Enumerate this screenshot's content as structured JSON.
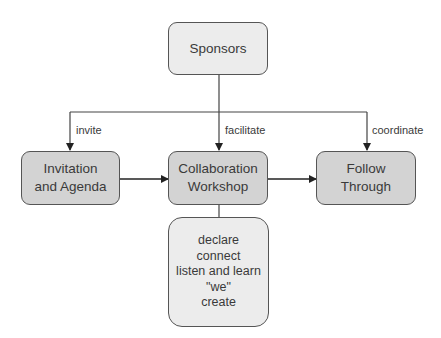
{
  "nodes": {
    "sponsors": {
      "label": "Sponsors"
    },
    "invitation": {
      "label": "Invitation\nand Agenda"
    },
    "workshop": {
      "label": "Collaboration\nWorkshop"
    },
    "follow": {
      "label": "Follow\nThrough"
    },
    "activities": {
      "label": "declare\nconnect\nlisten and learn\n\"we\"\ncreate"
    }
  },
  "edges": {
    "invite": "invite",
    "facilitate": "facilitate",
    "coordinate": "coordinate"
  },
  "colors": {
    "light_box": "#ececec",
    "mid_box": "#d3d3d3",
    "stroke": "#555555"
  }
}
